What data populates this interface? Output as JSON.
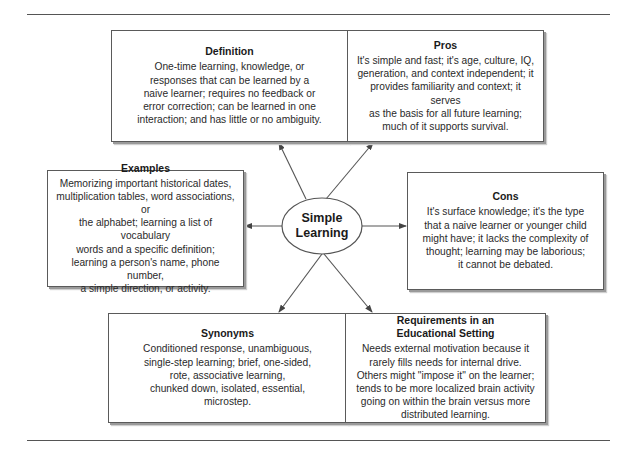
{
  "center": {
    "line1": "Simple",
    "line2": "Learning"
  },
  "boxes": {
    "definition": {
      "title": "Definition",
      "lines": [
        "One-time learning, knowledge, or",
        "responses that can be learned by a",
        "naive learner; requires no feedback or",
        "error correction; can be learned in one",
        "interaction; and has little or no ambiguity."
      ]
    },
    "pros": {
      "title": "Pros",
      "lines": [
        "It's simple and fast; it's age, culture, IQ,",
        "generation, and context independent; it",
        "provides familiarity and context; it serves",
        "as the basis for all future learning;",
        "much of it supports survival."
      ]
    },
    "examples": {
      "title": "Examples",
      "lines": [
        "Memorizing important historical dates,",
        "multiplication tables, word associations, or",
        "the alphabet; learning a list of vocabulary",
        "words and a specific definition;",
        "learning a person's name, phone number,",
        "a simple direction, or activity."
      ]
    },
    "cons": {
      "title": "Cons",
      "lines": [
        "It's surface knowledge; it's the type",
        "that a naive learner or younger child",
        "might have; it lacks the complexity of",
        "thought; learning may be laborious;",
        "it cannot be debated."
      ]
    },
    "synonyms": {
      "title": "Synonyms",
      "lines": [
        "Conditioned response, unambiguous,",
        "single-step learning; brief, one-sided,",
        "rote, associative learning,",
        "chunked down, isolated, essential,",
        "microstep."
      ]
    },
    "requirements": {
      "title_line1": "Requirements in an",
      "title_line2": "Educational Setting",
      "lines": [
        "Needs external motivation because it",
        "rarely fills needs for internal drive.",
        "Others might \"impose it\" on the learner;",
        "tends to be more localized brain activity",
        "going on within the brain versus more",
        "distributed learning."
      ]
    }
  },
  "colors": {
    "line": "#555555",
    "border": "#5a5a5a",
    "shadow": "#9a9a9a"
  }
}
